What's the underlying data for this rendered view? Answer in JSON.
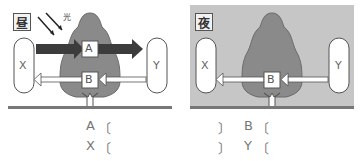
{
  "day_panel": {
    "tag": "昼",
    "light_label": "光",
    "box_a": "A",
    "box_b": "B",
    "left_capsule": "X",
    "right_capsule": "Y",
    "background": "#ffffff"
  },
  "night_panel": {
    "tag": "夜",
    "box_b": "B",
    "left_capsule": "X",
    "right_capsule": "Y",
    "background": "#c6c6c6"
  },
  "colors": {
    "tree": "#8a8a8a",
    "dark_arrow": "#3c3c3c",
    "ground": "#777777"
  },
  "answers": {
    "rows": [
      {
        "left_label": "A",
        "left_open": "〔",
        "right_close": "〕",
        "right_label": "B",
        "right_open": "〔"
      },
      {
        "left_label": "X",
        "left_open": "〔",
        "right_close": "〕",
        "right_label": "Y",
        "right_open": "〔"
      }
    ]
  }
}
